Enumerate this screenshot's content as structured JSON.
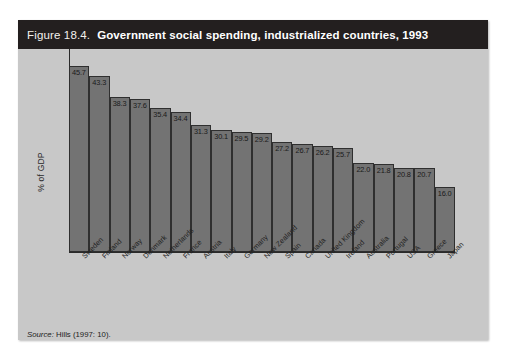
{
  "figure": {
    "number": "Figure 18.4.",
    "title": "Government social spending, industrialized countries, 1993",
    "source_label": "Source:",
    "source_text": " Hills (1997: 10)."
  },
  "colors": {
    "panel_background": "#c8c8c8",
    "header_background": "#231f1f",
    "header_text": "#ffffff",
    "bar_fill": "#737373",
    "bar_border": "#2f2f2f",
    "axis": "#2a2a2a",
    "label_text": "#1f1f1f",
    "page_background": "#ffffff"
  },
  "chart_data": {
    "type": "bar",
    "title": "Government social spending, industrialized countries, 1993",
    "xlabel": "",
    "ylabel": "% of GDP",
    "ylim": [
      0,
      50
    ],
    "grid": false,
    "legend": null,
    "categories": [
      "Sweden",
      "Finland",
      "Norway",
      "Denmark",
      "Netherlands",
      "France",
      "Austria",
      "Italy",
      "Germany",
      "New Zealand",
      "Spain",
      "Canada",
      "United Kingdom",
      "Ireland",
      "Australia",
      "Portugal",
      "USA",
      "Greece",
      "Japan"
    ],
    "values": [
      45.7,
      43.3,
      38.3,
      37.6,
      35.4,
      34.4,
      31.3,
      30.1,
      29.5,
      29.2,
      27.2,
      26.7,
      26.2,
      25.7,
      22.0,
      21.8,
      20.8,
      20.7,
      16.0
    ],
    "value_labels": [
      "45.7",
      "43.3",
      "38.3",
      "37.6",
      "35.4",
      "34.4",
      "31.3",
      "30.1",
      "29.5",
      "29.2",
      "27.2",
      "26.7",
      "26.2",
      "25.7",
      "22.0",
      "21.8",
      "20.8",
      "20.7",
      "16.0"
    ]
  }
}
